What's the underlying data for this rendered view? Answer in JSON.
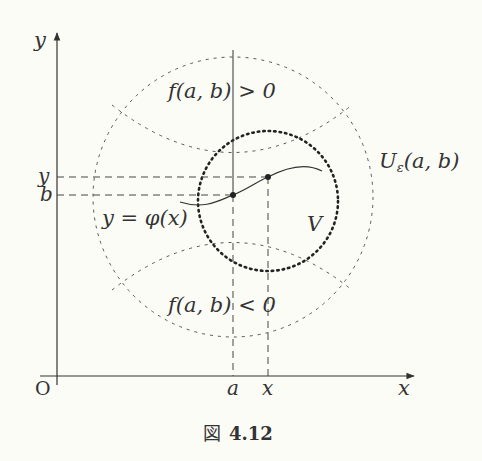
{
  "figure": {
    "caption_prefix": "図",
    "caption_number": "4.12",
    "labels": {
      "y_axis": "y",
      "x_axis": "x",
      "origin": "O",
      "tick_y": "y",
      "tick_b": "b",
      "tick_a": "a",
      "tick_x": "x",
      "region_positive": "f(a, b) > 0",
      "region_negative": "f(a, b) < 0",
      "implicit_function": "y = φ(x)",
      "neighborhood_U": "U",
      "neighborhood_U_sub": "ε",
      "neighborhood_U_arg": "(a, b)",
      "neighborhood_V": "V"
    },
    "colors": {
      "ink": "#333333",
      "background": "#fcfcf6"
    }
  }
}
